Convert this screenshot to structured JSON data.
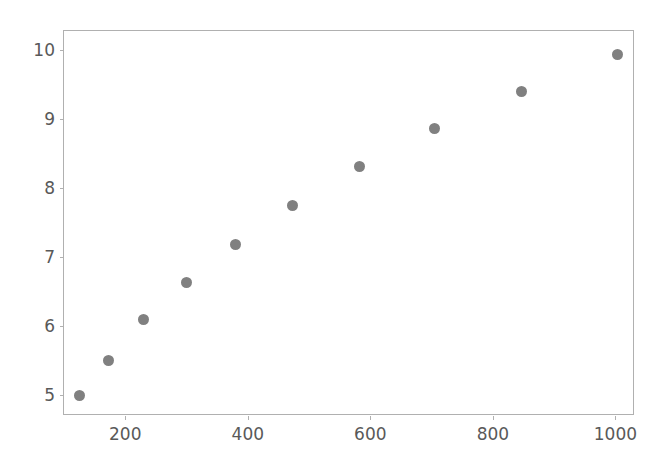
{
  "chart_data": {
    "type": "scatter",
    "title": "",
    "xlabel": "",
    "ylabel": "",
    "xlim": [
      100,
      1032
    ],
    "ylim": [
      4.7,
      10.28
    ],
    "xticks": [
      200,
      400,
      600,
      800,
      1000
    ],
    "yticks": [
      5,
      6,
      7,
      8,
      9,
      10
    ],
    "xtick_labels": [
      "200",
      "400",
      "600",
      "800",
      "1000"
    ],
    "ytick_labels": [
      "5",
      "6",
      "7",
      "8",
      "9",
      "10"
    ],
    "grid": false,
    "legend": null,
    "legend_position": "none",
    "marker": {
      "shape": "circle",
      "color": "#808080",
      "size_px": 11
    },
    "series": [
      {
        "name": "series-1",
        "x": [
          125,
          173,
          230,
          300,
          380,
          473,
          583,
          705,
          847,
          1003
        ],
        "y": [
          5.0,
          5.51,
          6.1,
          6.64,
          7.19,
          7.75,
          8.31,
          8.86,
          9.4,
          9.94
        ]
      }
    ],
    "points": [
      {
        "x": 125,
        "y": 5.0
      },
      {
        "x": 173,
        "y": 5.51
      },
      {
        "x": 230,
        "y": 6.1
      },
      {
        "x": 300,
        "y": 6.64
      },
      {
        "x": 380,
        "y": 7.19
      },
      {
        "x": 473,
        "y": 7.75
      },
      {
        "x": 583,
        "y": 8.31
      },
      {
        "x": 705,
        "y": 8.86
      },
      {
        "x": 847,
        "y": 9.4
      },
      {
        "x": 1003,
        "y": 9.94
      }
    ],
    "annotations": [],
    "colors": {
      "background": "#ffffff",
      "spine": "#b0b0b0",
      "tick_label": "#595959",
      "marker": "#808080"
    }
  }
}
